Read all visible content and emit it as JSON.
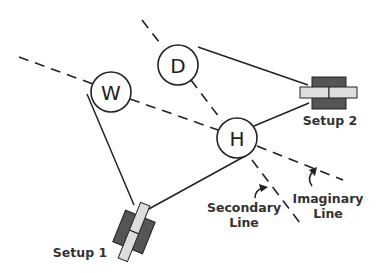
{
  "diagram": {
    "nodes": [
      {
        "id": "W",
        "label": "W",
        "cx": 111,
        "cy": 92,
        "r": 20
      },
      {
        "id": "D",
        "label": "D",
        "cx": 178,
        "cy": 65,
        "r": 20
      },
      {
        "id": "H",
        "label": "H",
        "cx": 237,
        "cy": 138,
        "r": 20
      }
    ],
    "cameras": [
      {
        "id": "setup1",
        "label": "Setup 1"
      },
      {
        "id": "setup2",
        "label": "Setup 2"
      }
    ],
    "annotations": {
      "secondary_line": [
        "Secondary",
        "Line"
      ],
      "imaginary_line": [
        "Imaginary",
        "Line"
      ]
    },
    "colors": {
      "line": "#222222",
      "camera_body": "#555555",
      "camera_lens": "#dddddd",
      "text": "#333333"
    }
  }
}
